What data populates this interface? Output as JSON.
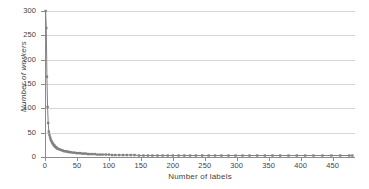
{
  "chart_data": {
    "type": "scatter",
    "title": "",
    "xlabel": "Number of labels",
    "ylabel": "Number of workers",
    "xlim": [
      0,
      485
    ],
    "ylim": [
      0,
      300
    ],
    "grid": true,
    "legend": null,
    "series_color": "#808080",
    "gridline_color": "#d6d6d6",
    "axis_color": "#8c8c8c",
    "background_color": "#ffffff",
    "xticks": [
      0,
      50,
      100,
      150,
      200,
      250,
      300,
      350,
      400,
      450
    ],
    "yticks": [
      0,
      50,
      100,
      150,
      200,
      250,
      300
    ],
    "series": [
      {
        "name": "workers per label count",
        "x": [
          1,
          2,
          3,
          4,
          5,
          6,
          7,
          8,
          9,
          10,
          11,
          12,
          13,
          14,
          15,
          16,
          17,
          18,
          19,
          20,
          22,
          24,
          26,
          28,
          30,
          32,
          34,
          36,
          38,
          40,
          43,
          46,
          49,
          52,
          55,
          58,
          61,
          64,
          67,
          70,
          74,
          78,
          82,
          86,
          90,
          95,
          100,
          105,
          110,
          116,
          122,
          128,
          134,
          140,
          147,
          154,
          161,
          168,
          176,
          184,
          192,
          200,
          209,
          218,
          227,
          236,
          246,
          256,
          266,
          276,
          287,
          298,
          309,
          320,
          332,
          344,
          356,
          368,
          381,
          394,
          407,
          420,
          434,
          448,
          462,
          476,
          481
        ],
        "y": [
          300,
          265,
          165,
          103,
          70,
          52,
          45,
          40,
          36,
          33,
          30,
          28,
          26,
          24,
          23,
          21,
          20,
          19,
          18,
          17,
          16,
          15,
          14,
          13,
          12,
          12,
          11,
          11,
          10,
          10,
          9,
          9,
          8,
          8,
          8,
          7,
          7,
          7,
          6,
          6,
          6,
          6,
          5,
          5,
          5,
          5,
          5,
          4,
          4,
          4,
          4,
          4,
          4,
          4,
          3,
          3,
          3,
          3,
          3,
          3,
          3,
          3,
          3,
          3,
          3,
          3,
          3,
          3,
          3,
          3,
          3,
          3,
          3,
          3,
          3,
          3,
          3,
          3,
          3,
          3,
          3,
          3,
          3,
          3,
          3,
          3,
          3
        ]
      }
    ]
  }
}
